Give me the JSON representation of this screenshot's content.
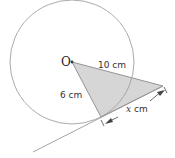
{
  "diagram": {
    "center_label": "O",
    "labels": {
      "hypotenuse": "10 cm",
      "radius": "6 cm",
      "tangent_var": "x",
      "tangent_unit": " cm"
    },
    "colors": {
      "circle": "#9a9a9a",
      "triangle_fill": "#d4d4d4",
      "triangle_stroke": "#8a8a8a",
      "tangent_line": "#9a9a9a",
      "text": "#333333"
    }
  }
}
